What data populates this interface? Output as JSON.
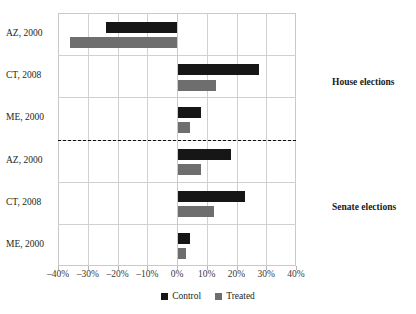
{
  "chart_data": {
    "type": "bar",
    "orientation": "horizontal",
    "title": "",
    "xlabel": "",
    "ylabel": "",
    "xlim": [
      -40,
      40
    ],
    "xtick_labels": [
      "–40%",
      "–30%",
      "–20%",
      "–10%",
      "0%",
      "10%",
      "20%",
      "30%",
      "40%"
    ],
    "xtick_values": [
      -40,
      -30,
      -20,
      -10,
      0,
      10,
      20,
      30,
      40
    ],
    "grid": true,
    "legend_position": "bottom-center",
    "categories": [
      "AZ, 2000",
      "CT, 2008",
      "ME, 2000",
      "AZ, 2000",
      "CT, 2008",
      "ME, 2000"
    ],
    "series": [
      {
        "name": "Control",
        "color": "#161616",
        "values": [
          -24,
          27.5,
          8,
          18,
          23,
          4.5
        ]
      },
      {
        "name": "Treated",
        "color": "#6e6e6e",
        "values": [
          -36,
          13,
          4.5,
          8,
          12.5,
          3
        ]
      }
    ],
    "panels": [
      {
        "label": "House elections",
        "categories": [
          "AZ, 2000",
          "CT, 2008",
          "ME, 2000"
        ]
      },
      {
        "label": "Senate elections",
        "categories": [
          "AZ, 2000",
          "CT, 2008",
          "ME, 2000"
        ]
      }
    ],
    "annotations": [
      {
        "text": "House elections",
        "position": "right-of-plot-upper"
      },
      {
        "text": "Senate elections",
        "position": "right-of-plot-lower"
      }
    ],
    "divider": {
      "style": "dashed",
      "between": [
        "House elections",
        "Senate elections"
      ]
    }
  },
  "legend": {
    "items": [
      {
        "label": "Control",
        "color": "#161616"
      },
      {
        "label": "Treated",
        "color": "#6e6e6e"
      }
    ]
  }
}
